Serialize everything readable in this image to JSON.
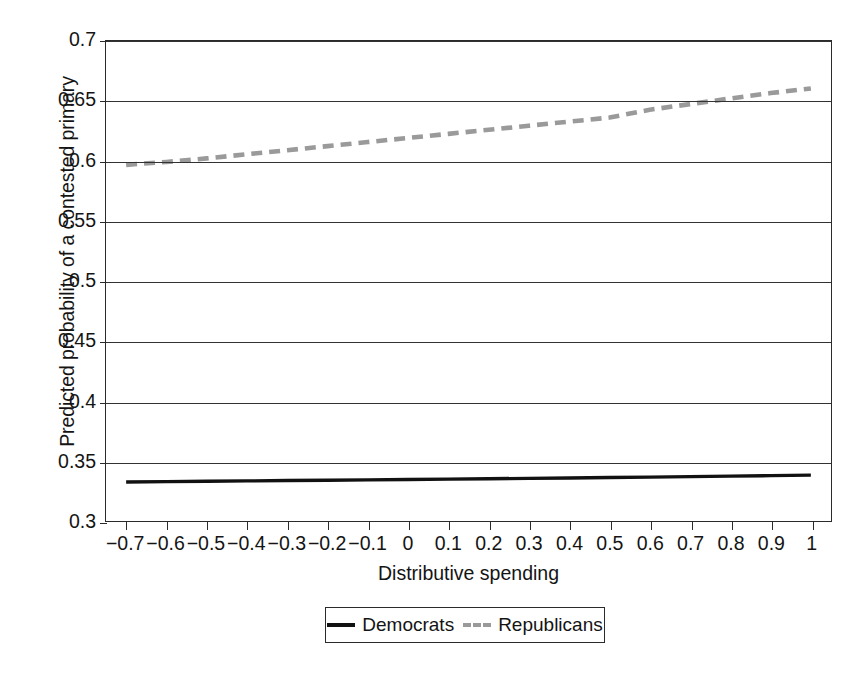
{
  "chart_data": {
    "type": "line",
    "title": "",
    "xlabel": "Distributive spending",
    "ylabel": "Predicted probability of a contested primary",
    "xlim": [
      -0.75,
      1.05
    ],
    "ylim": [
      0.3,
      0.7
    ],
    "grid": "horizontal",
    "legend_position": "bottom-center",
    "x_ticks": [
      "−0.7",
      "−0.6",
      "−0.5",
      "−0.4",
      "−0.3",
      "−0.2",
      "−0.1",
      "0",
      "0.1",
      "0.2",
      "0.3",
      "0.4",
      "0.5",
      "0.6",
      "0.7",
      "0.8",
      "0.9",
      "1"
    ],
    "x_tick_values": [
      -0.7,
      -0.6,
      -0.5,
      -0.4,
      -0.3,
      -0.2,
      -0.1,
      0,
      0.1,
      0.2,
      0.3,
      0.4,
      0.5,
      0.6,
      0.7,
      0.8,
      0.9,
      1
    ],
    "y_ticks": [
      "0.3",
      "0.35",
      "0.4",
      "0.45",
      "0.5",
      "0.55",
      "0.6",
      "0.65",
      "0.7"
    ],
    "y_tick_values": [
      0.3,
      0.35,
      0.4,
      0.45,
      0.5,
      0.55,
      0.6,
      0.65,
      0.7
    ],
    "x": [
      -0.7,
      -0.6,
      -0.5,
      -0.4,
      -0.3,
      -0.2,
      -0.1,
      0,
      0.1,
      0.2,
      0.3,
      0.4,
      0.5,
      0.6,
      0.7,
      0.8,
      0.9,
      1
    ],
    "series": [
      {
        "name": "Democrats",
        "style": "solid",
        "color": "#111111",
        "values": [
          0.3325,
          0.3328,
          0.3331,
          0.3334,
          0.3337,
          0.334,
          0.3343,
          0.3346,
          0.3349,
          0.3352,
          0.3355,
          0.3358,
          0.3362,
          0.3366,
          0.337,
          0.3374,
          0.3378,
          0.3382
        ]
      },
      {
        "name": "Republicans",
        "style": "dashed",
        "color": "#9a9a9a",
        "values": [
          0.5968,
          0.5992,
          0.6022,
          0.6056,
          0.609,
          0.6124,
          0.6158,
          0.6192,
          0.6226,
          0.626,
          0.6294,
          0.6328,
          0.6362,
          0.6427,
          0.6474,
          0.6521,
          0.6566,
          0.6605
        ]
      }
    ]
  },
  "legend": {
    "entries": [
      {
        "label": "Democrats"
      },
      {
        "label": "Republicans"
      }
    ]
  }
}
